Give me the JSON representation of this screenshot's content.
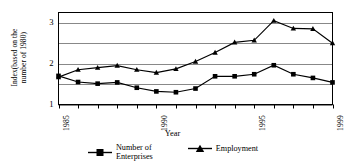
{
  "chart_data": {
    "type": "line",
    "title": "",
    "xlabel": "Year",
    "ylabel_line1": "Index(based on the",
    "ylabel_line2": "number of 1980)",
    "x": [
      1985,
      1986,
      1987,
      1988,
      1989,
      1990,
      1991,
      1992,
      1993,
      1994,
      1995,
      1996,
      1997,
      1998,
      1999
    ],
    "xtick_labels": [
      "1985",
      "1990",
      "1995",
      "1999"
    ],
    "xtick_values": [
      1985,
      1990,
      1995,
      1999
    ],
    "ytick_labels": [
      "1",
      "2",
      "3"
    ],
    "ytick_values": [
      1,
      2,
      3
    ],
    "gridline_values": [
      1,
      1.5,
      2,
      2.5,
      3
    ],
    "xlim": [
      1985,
      1999
    ],
    "ylim": [
      1,
      3.25
    ],
    "grid": true,
    "legend_position": "bottom",
    "series": [
      {
        "name": "Number of Enterprises",
        "name_line1": "Number of",
        "name_line2": "Enterprises",
        "marker": "square",
        "color": "#000000",
        "values": [
          1.7,
          1.55,
          1.51,
          1.54,
          1.41,
          1.32,
          1.3,
          1.39,
          1.69,
          1.69,
          1.74,
          1.96,
          1.74,
          1.65,
          1.54
        ]
      },
      {
        "name": "Employment",
        "name_line1": "Employment",
        "name_line2": "",
        "marker": "triangle",
        "color": "#000000",
        "values": [
          1.67,
          1.85,
          1.9,
          1.95,
          1.85,
          1.78,
          1.87,
          2.05,
          2.27,
          2.52,
          2.57,
          3.05,
          2.86,
          2.85,
          2.5
        ]
      }
    ]
  },
  "legend": {
    "items": [
      {
        "label_line1": "Number of",
        "label_line2": "Enterprises",
        "marker": "square-marker-icon"
      },
      {
        "label_line1": "Employment",
        "label_line2": "",
        "marker": "triangle-marker-icon"
      }
    ]
  }
}
